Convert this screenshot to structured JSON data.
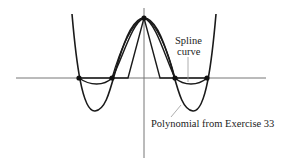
{
  "figure": {
    "labels": {
      "spline_line1": "Spline",
      "spline_line2": "curve",
      "polynomial": "Polynomial from Exercise 33"
    },
    "curves": [
      {
        "name": "polynomial",
        "description": "Degree-4 polynomial through 5 points"
      },
      {
        "name": "spline",
        "description": "Cubic spline through the same points"
      },
      {
        "name": "piecewise-linear",
        "description": "Hat function (linear pieces)"
      }
    ],
    "points": [
      {
        "x": -2,
        "y": 0
      },
      {
        "x": -1,
        "y": 0
      },
      {
        "x": 0,
        "y": 1
      },
      {
        "x": 1,
        "y": 0
      },
      {
        "x": 2,
        "y": 0
      }
    ],
    "colors": {
      "curve": "#1a1a1a",
      "axis": "#777777",
      "leader": "#999999"
    }
  }
}
